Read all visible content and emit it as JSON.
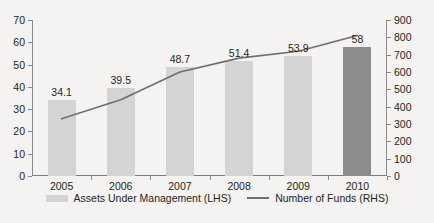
{
  "chart_data": {
    "type": "bar",
    "title": "",
    "xlabel": "",
    "ylabel": "",
    "grid": false,
    "legend_position": "bottom",
    "categories": [
      "2005",
      "2006",
      "2007",
      "2008",
      "2009",
      "2010"
    ],
    "axes": {
      "left": {
        "name": "Assets Under Management (LHS)",
        "min": 0,
        "max": 70,
        "step": 10,
        "ticks": [
          "0",
          "10",
          "20",
          "30",
          "40",
          "50",
          "60",
          "70"
        ]
      },
      "right": {
        "name": "Number of Funds (RHS)",
        "min": 0,
        "max": 900,
        "step": 100,
        "ticks": [
          "0",
          "100",
          "200",
          "300",
          "400",
          "500",
          "600",
          "700",
          "800",
          "900"
        ]
      }
    },
    "series": [
      {
        "name": "Assets Under Management (LHS)",
        "type": "bar",
        "axis": "left",
        "color": "#d4d4d4",
        "highlight_color": "#8c8c8c",
        "highlight_index": 5,
        "values": [
          34.1,
          39.5,
          48.7,
          51.4,
          53.9,
          58
        ],
        "labels": [
          "34.1",
          "39.5",
          "48.7",
          "51.4",
          "53.9",
          "58"
        ]
      },
      {
        "name": "Number of Funds (RHS)",
        "type": "line",
        "axis": "right",
        "color": "#6f6f6f",
        "values": [
          330,
          440,
          600,
          680,
          720,
          810
        ]
      }
    ]
  },
  "legend": {
    "items": [
      {
        "label": "Assets Under Management (LHS)",
        "marker": "bar-swatch"
      },
      {
        "label": "Number of Funds (RHS)",
        "marker": "line-swatch"
      }
    ]
  }
}
